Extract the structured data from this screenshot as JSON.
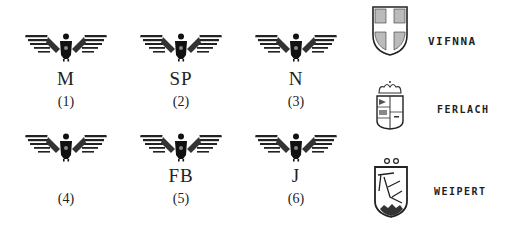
{
  "eagle_marks": [
    {
      "letter": "M",
      "number": "(1)"
    },
    {
      "letter": "SP",
      "number": "(2)"
    },
    {
      "letter": "N",
      "number": "(3)"
    },
    {
      "letter": "",
      "number": "(4)"
    },
    {
      "letter": "FB",
      "number": "(5)"
    },
    {
      "letter": "J",
      "number": "(6)"
    }
  ],
  "city_marks": [
    {
      "label": "VIFNNA",
      "icon": "shield-cross-icon"
    },
    {
      "label": "FERLACH",
      "icon": "crowned-shield-icon"
    },
    {
      "label": "WEIPERT",
      "icon": "shield-branch-icon"
    }
  ],
  "colors": {
    "ink": "#1a1a1a",
    "background": "#ffffff"
  }
}
